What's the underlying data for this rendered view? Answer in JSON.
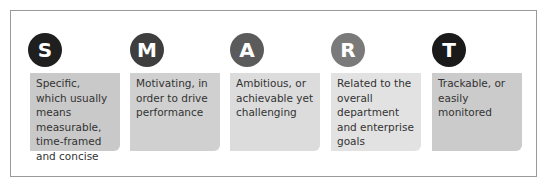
{
  "items": [
    {
      "letter": "S",
      "text": "Specific, which usually means measurable, time-framed and concise",
      "circle_color": "#1f1f1f",
      "box_color": "#c9c9c9"
    },
    {
      "letter": "M",
      "text": "Motivating, in order to drive performance",
      "circle_color": "#3e3e3e",
      "box_color": "#d0d0d0"
    },
    {
      "letter": "A",
      "text": "Ambitious, or achievable yet challenging",
      "circle_color": "#5b5b5b",
      "box_color": "#dcdcdc"
    },
    {
      "letter": "R",
      "text": "Related to the overall department and enterprise goals",
      "circle_color": "#7a7a7a",
      "box_color": "#e2e2e2"
    },
    {
      "letter": "T",
      "text": "Trackable, or easily monitored",
      "circle_color": "#1a1a1a",
      "box_color": "#cbcbcb"
    }
  ]
}
